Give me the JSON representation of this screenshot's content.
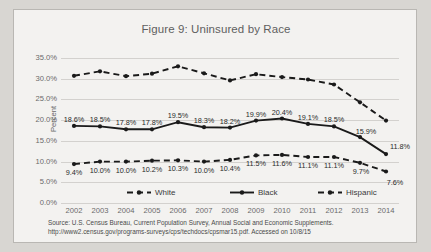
{
  "figure": {
    "title": "Figure 9: Uninsured by Race",
    "yaxis_title": "Percent",
    "source_line1": "Source: U.S. Census Bureau, Current Population Survey, Annual Social and Economic Supplements.",
    "source_line2": "http://www2.census.gov/programs-surveys/cps/techdocs/cpsmar15.pdf. Accessed on 10/8/15"
  },
  "chart_data": {
    "type": "line",
    "title": "Figure 9: Uninsured by Race",
    "xlabel": "",
    "ylabel": "Percent",
    "ylim": [
      0,
      35
    ],
    "ytick_labels": [
      "0.0%",
      "5.0%",
      "10.0%",
      "15.0%",
      "20.0%",
      "25.0%",
      "30.0%",
      "35.0%"
    ],
    "ytick_values": [
      0,
      5,
      10,
      15,
      20,
      25,
      30,
      35
    ],
    "grid": true,
    "legend_position": "bottom",
    "categories": [
      "2002",
      "2003",
      "2004",
      "2005",
      "2006",
      "2007",
      "2008",
      "2009",
      "2010",
      "2011",
      "2012",
      "2013",
      "2014"
    ],
    "series": [
      {
        "name": "White",
        "style": "dashed",
        "color": "#1a1a1a",
        "values": [
          9.4,
          10.0,
          10.0,
          10.2,
          10.3,
          10.0,
          10.4,
          11.5,
          11.6,
          11.1,
          11.1,
          9.7,
          7.6
        ],
        "labels": [
          "9.4%",
          "10.0%",
          "10.0%",
          "10.2%",
          "10.3%",
          "10.0%",
          "10.4%",
          "11.5%",
          "11.6%",
          "11.1%",
          "11.1%",
          "9.7%",
          "7.6%"
        ],
        "labels_shown": true
      },
      {
        "name": "Black",
        "style": "solid",
        "color": "#1a1a1a",
        "values": [
          18.6,
          18.5,
          17.8,
          17.8,
          19.5,
          18.3,
          18.2,
          19.9,
          20.4,
          19.1,
          18.5,
          15.9,
          11.8
        ],
        "labels": [
          "18.6%",
          "18.5%",
          "17.8%",
          "17.8%",
          "19.5%",
          "18.3%",
          "18.2%",
          "19.9%",
          "20.4%",
          "19.1%",
          "18.5%",
          "15.9%",
          "11.8%"
        ],
        "labels_shown": true
      },
      {
        "name": "Hispanic",
        "style": "dashed",
        "color": "#1a1a1a",
        "values": [
          30.7,
          31.8,
          30.6,
          31.2,
          33.0,
          31.3,
          29.6,
          31.1,
          30.4,
          29.8,
          28.6,
          24.3,
          19.9
        ],
        "labels": [],
        "labels_shown": false
      }
    ]
  },
  "legend": {
    "items": [
      {
        "label": "White"
      },
      {
        "label": "Black"
      },
      {
        "label": "Hispanic"
      }
    ]
  }
}
